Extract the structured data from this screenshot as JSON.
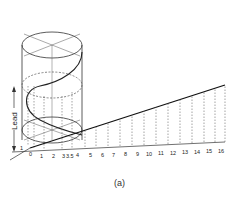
{
  "figure": {
    "caption": "(a)",
    "lead_label": "Lead",
    "base_ticks": [
      "0",
      "1",
      "2",
      "3",
      "3.5",
      "4",
      "5",
      "6",
      "7",
      "8",
      "9",
      "10",
      "11",
      "12",
      "13",
      "14",
      "15",
      "16"
    ],
    "left_marks": [
      "1",
      "1"
    ],
    "colors": {
      "line": "#222222",
      "dashed": "#555555",
      "background": "#ffffff"
    }
  }
}
